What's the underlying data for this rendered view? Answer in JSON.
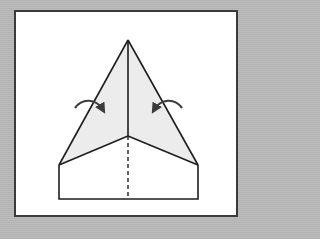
{
  "diagram": {
    "instruction": "fold both outer edges in to the center crease",
    "colors": {
      "background": "#b9b9b9",
      "panel": "#ffffff",
      "outline": "#1e1e1e",
      "shaded_flap": "#ececec",
      "arrow": "#3c3c3c"
    },
    "elements": [
      {
        "name": "left-flap",
        "role": "shaded flap to fold"
      },
      {
        "name": "right-flap",
        "role": "shaded flap to fold"
      },
      {
        "name": "center-crease",
        "style": "solid"
      },
      {
        "name": "lower-crease",
        "style": "dashed"
      },
      {
        "name": "left-fold-arrow",
        "direction": "inward"
      },
      {
        "name": "right-fold-arrow",
        "direction": "inward"
      }
    ]
  }
}
